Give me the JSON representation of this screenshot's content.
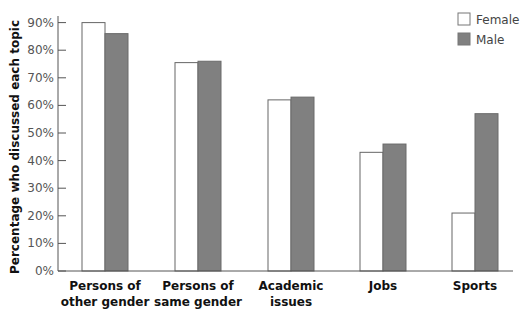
{
  "chart_data": {
    "type": "bar",
    "title": "",
    "xlabel": "",
    "ylabel": "Percentage who discussed each topic",
    "ylim": [
      0,
      90
    ],
    "yticks": [
      "0%",
      "10%",
      "20%",
      "30%",
      "40%",
      "50%",
      "60%",
      "70%",
      "80%",
      "90%"
    ],
    "grid": false,
    "legend_position": "top-right",
    "categories": [
      [
        "Persons of",
        "other gender"
      ],
      [
        "Persons of",
        "same gender"
      ],
      [
        "Academic",
        "issues"
      ],
      [
        "Jobs"
      ],
      [
        "Sports"
      ]
    ],
    "series": [
      {
        "name": "Female",
        "color": "#ffffff",
        "values": [
          90,
          75.5,
          62,
          43,
          21
        ]
      },
      {
        "name": "Male",
        "color": "#808080",
        "values": [
          86,
          76,
          63,
          46,
          57
        ]
      }
    ]
  },
  "legend": {
    "items": [
      {
        "label": "Female",
        "color": "#ffffff"
      },
      {
        "label": "Male",
        "color": "#808080"
      }
    ]
  }
}
